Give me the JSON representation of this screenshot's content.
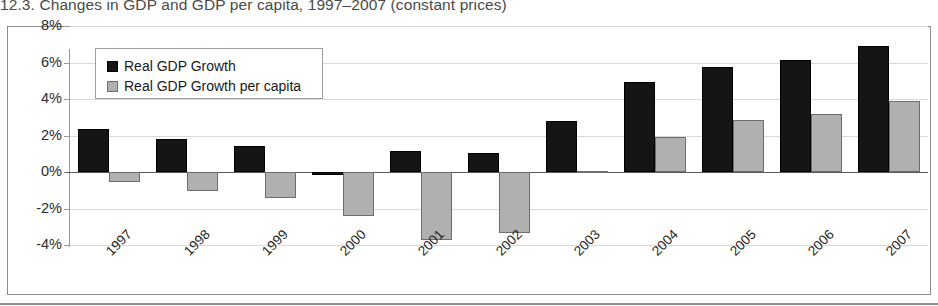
{
  "caption": "12.3. Changes in GDP and GDP per capita, 1997–2007 (constant prices)",
  "colors": {
    "series_black": "#151515",
    "series_gray": "#b0b0b0",
    "grid": "#d9d9d9",
    "axis": "#9a9a9a",
    "frame": "#8c8c8c"
  },
  "legend": {
    "items": [
      {
        "label": "Real GDP Growth",
        "swatch": "black"
      },
      {
        "label": "Real GDP Growth per capita",
        "swatch": "gray"
      }
    ]
  },
  "yaxis": {
    "ticks": [
      "8%",
      "6%",
      "4%",
      "2%",
      "0%",
      "-2%",
      "-4%"
    ],
    "values": [
      8,
      6,
      4,
      2,
      0,
      -2,
      -4
    ]
  },
  "chart_data": {
    "type": "bar",
    "title": "12.3. Changes in GDP and GDP per capita, 1997–2007 (constant prices)",
    "xlabel": "",
    "ylabel": "",
    "ylim": [
      -4,
      8
    ],
    "ytick_values": [
      -4,
      -2,
      0,
      2,
      4,
      6,
      8
    ],
    "ytick_labels": [
      "-4%",
      "-2%",
      "0%",
      "2%",
      "4%",
      "6%",
      "8%"
    ],
    "grid": true,
    "legend_position": "top-left",
    "categories": [
      "1997",
      "1998",
      "1999",
      "2000",
      "2001",
      "2002",
      "2003",
      "2004",
      "2005",
      "2006",
      "2007"
    ],
    "series": [
      {
        "name": "Real GDP Growth",
        "color": "#151515",
        "values": [
          2.35,
          1.8,
          1.45,
          -0.15,
          1.15,
          1.05,
          2.8,
          4.95,
          5.75,
          6.15,
          6.9
        ]
      },
      {
        "name": "Real GDP Growth per capita",
        "color": "#b0b0b0",
        "values": [
          -0.55,
          -1.05,
          -1.45,
          -2.4,
          -3.7,
          -3.35,
          0.05,
          1.9,
          2.85,
          3.2,
          3.9
        ]
      }
    ]
  }
}
